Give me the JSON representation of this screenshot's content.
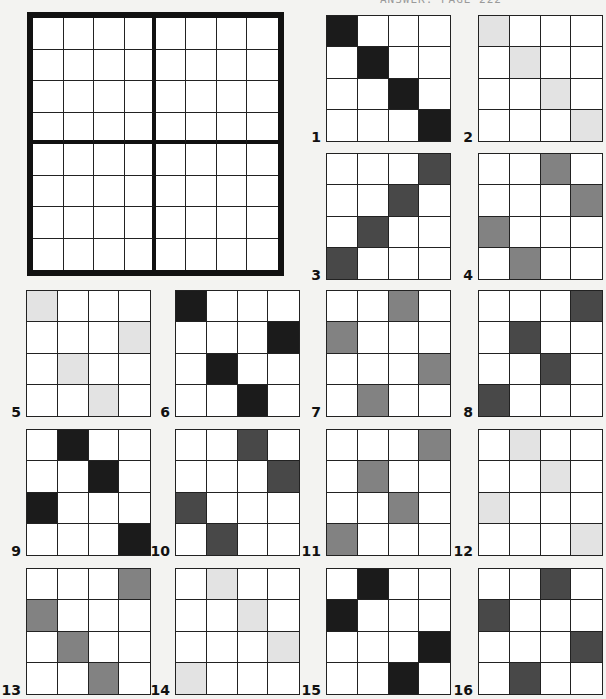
{
  "header": {
    "text": "ANSWER: PAGE 222"
  },
  "main_grid": {
    "rows": 8,
    "cols": 8,
    "box_rows": 4,
    "box_cols": 4
  },
  "shades": {
    "black": "#1b1b1b",
    "dark": "#484848",
    "medium": "#828282",
    "light": "#e3e3e3"
  },
  "puzzles": [
    {
      "number": "1",
      "shade": "black",
      "x": 326,
      "y": 15,
      "filled": [
        [
          0,
          0
        ],
        [
          1,
          1
        ],
        [
          2,
          2
        ],
        [
          3,
          3
        ]
      ]
    },
    {
      "number": "2",
      "shade": "light",
      "x": 478,
      "y": 15,
      "filled": [
        [
          0,
          0
        ],
        [
          1,
          1
        ],
        [
          2,
          2
        ],
        [
          3,
          3
        ]
      ]
    },
    {
      "number": "3",
      "shade": "dark",
      "x": 326,
      "y": 153,
      "filled": [
        [
          0,
          3
        ],
        [
          1,
          2
        ],
        [
          2,
          1
        ],
        [
          3,
          0
        ]
      ]
    },
    {
      "number": "4",
      "shade": "medium",
      "x": 478,
      "y": 153,
      "filled": [
        [
          0,
          2
        ],
        [
          1,
          3
        ],
        [
          2,
          0
        ],
        [
          3,
          1
        ]
      ]
    },
    {
      "number": "5",
      "shade": "light",
      "x": 26,
      "y": 290,
      "filled": [
        [
          0,
          0
        ],
        [
          1,
          3
        ],
        [
          2,
          1
        ],
        [
          3,
          2
        ]
      ]
    },
    {
      "number": "6",
      "shade": "black",
      "x": 175,
      "y": 290,
      "filled": [
        [
          0,
          0
        ],
        [
          1,
          3
        ],
        [
          2,
          1
        ],
        [
          3,
          2
        ]
      ]
    },
    {
      "number": "7",
      "shade": "medium",
      "x": 326,
      "y": 290,
      "filled": [
        [
          0,
          2
        ],
        [
          1,
          0
        ],
        [
          2,
          3
        ],
        [
          3,
          1
        ]
      ]
    },
    {
      "number": "8",
      "shade": "dark",
      "x": 478,
      "y": 290,
      "filled": [
        [
          0,
          3
        ],
        [
          1,
          1
        ],
        [
          2,
          2
        ],
        [
          3,
          0
        ]
      ]
    },
    {
      "number": "9",
      "shade": "black",
      "x": 26,
      "y": 429,
      "filled": [
        [
          0,
          1
        ],
        [
          1,
          2
        ],
        [
          2,
          0
        ],
        [
          3,
          3
        ]
      ]
    },
    {
      "number": "10",
      "shade": "dark",
      "x": 175,
      "y": 429,
      "filled": [
        [
          0,
          2
        ],
        [
          1,
          3
        ],
        [
          2,
          0
        ],
        [
          3,
          1
        ]
      ]
    },
    {
      "number": "11",
      "shade": "medium",
      "x": 326,
      "y": 429,
      "filled": [
        [
          0,
          3
        ],
        [
          1,
          1
        ],
        [
          2,
          2
        ],
        [
          3,
          0
        ]
      ]
    },
    {
      "number": "12",
      "shade": "light",
      "x": 478,
      "y": 429,
      "filled": [
        [
          0,
          1
        ],
        [
          1,
          2
        ],
        [
          2,
          0
        ],
        [
          3,
          3
        ]
      ]
    },
    {
      "number": "13",
      "shade": "medium",
      "x": 26,
      "y": 568,
      "filled": [
        [
          0,
          3
        ],
        [
          1,
          0
        ],
        [
          2,
          1
        ],
        [
          3,
          2
        ]
      ]
    },
    {
      "number": "14",
      "shade": "light",
      "x": 175,
      "y": 568,
      "filled": [
        [
          0,
          1
        ],
        [
          1,
          2
        ],
        [
          2,
          3
        ],
        [
          3,
          0
        ]
      ]
    },
    {
      "number": "15",
      "shade": "black",
      "x": 326,
      "y": 568,
      "filled": [
        [
          0,
          1
        ],
        [
          1,
          0
        ],
        [
          2,
          3
        ],
        [
          3,
          2
        ]
      ]
    },
    {
      "number": "16",
      "shade": "dark",
      "x": 478,
      "y": 568,
      "filled": [
        [
          0,
          2
        ],
        [
          1,
          0
        ],
        [
          2,
          3
        ],
        [
          3,
          1
        ]
      ]
    }
  ]
}
